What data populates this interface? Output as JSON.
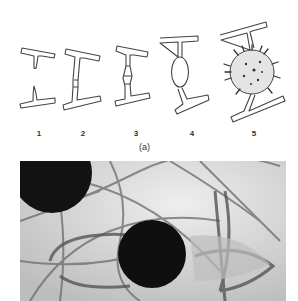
{
  "figure": {
    "panel_a": {
      "caption": "(a)",
      "stages": [
        {
          "label": "1",
          "description": "two separate T-shaped hyphal segments"
        },
        {
          "label": "2",
          "description": "fused I-shaped pair with joint"
        },
        {
          "label": "3",
          "description": "fused pair with swollen junction"
        },
        {
          "label": "4",
          "description": "I-shape with oval swelling at center"
        },
        {
          "label": "5",
          "description": "I-shape with spiny spherical zygospore"
        }
      ]
    },
    "panel_b": {
      "description": "grayscale micrograph of hyphae with dark spherical spores"
    }
  }
}
